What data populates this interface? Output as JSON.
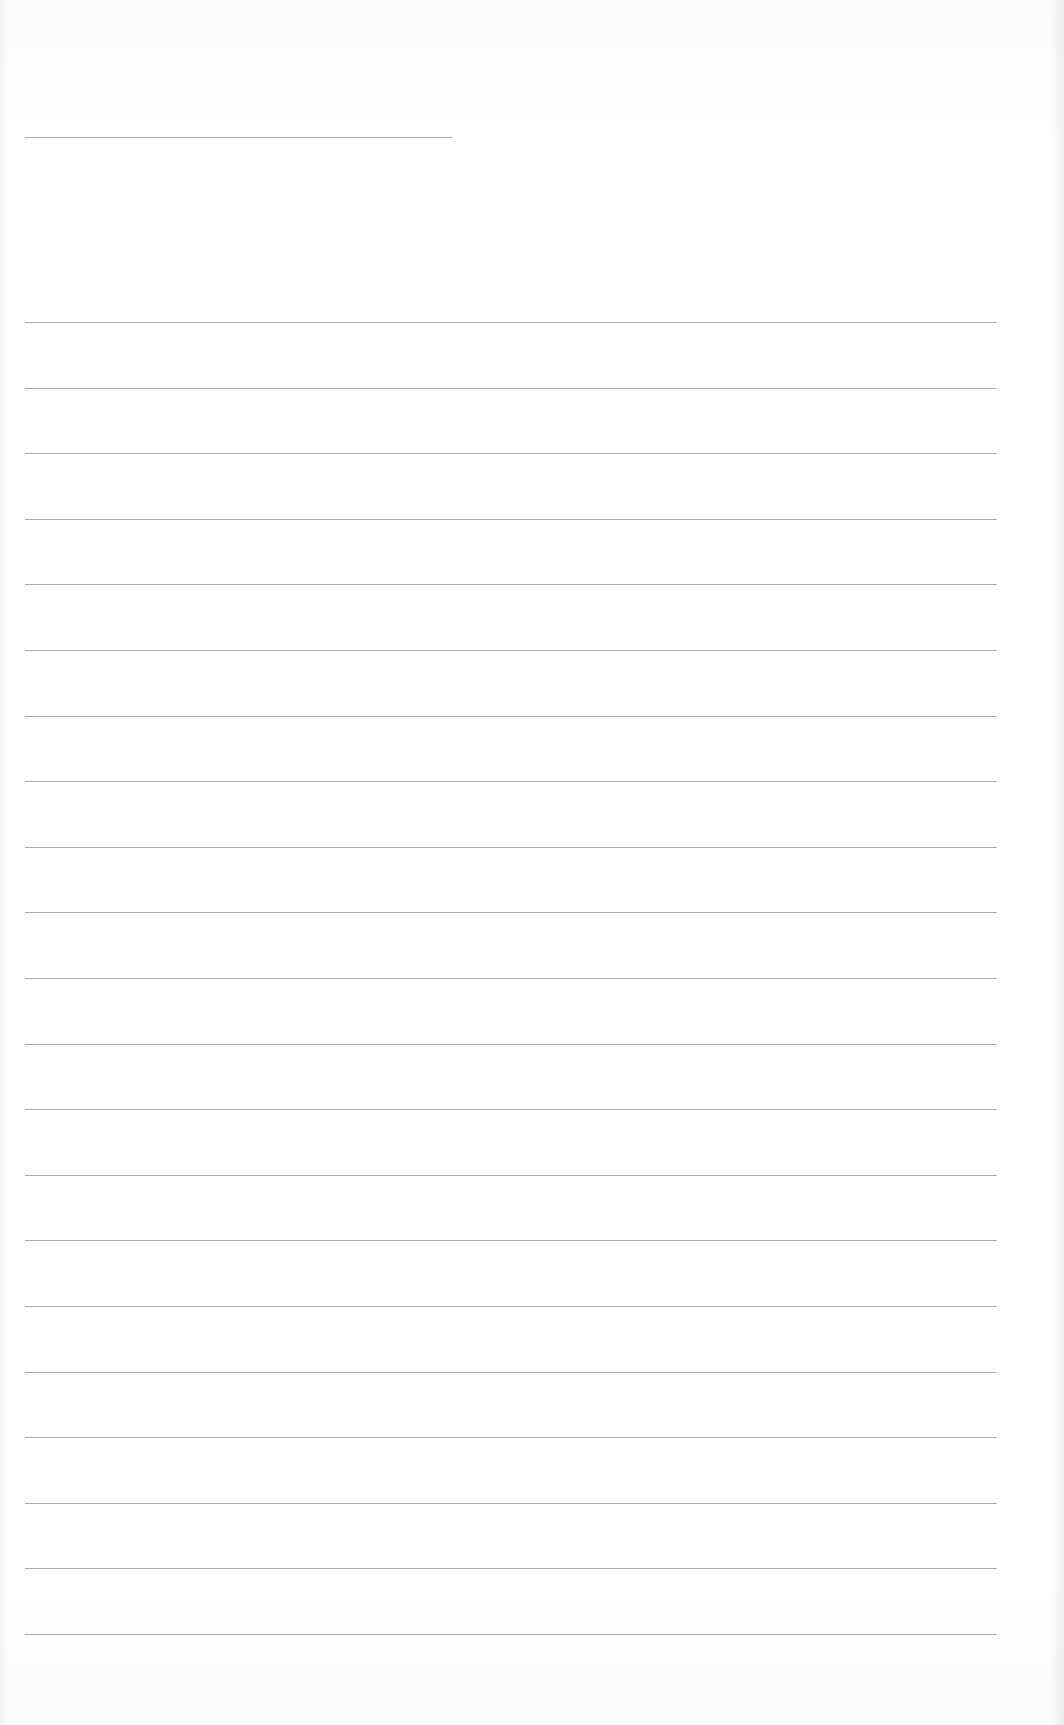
{
  "document": {
    "type": "lined-writing-sheet",
    "background_color": "#ffffff",
    "rule_color": "#9a9a9a",
    "title_rule": {
      "y": 137,
      "x_start": 25,
      "x_end": 452
    },
    "body_rules": {
      "count": 21,
      "first_y": 322,
      "spacing": 65.6,
      "x_start": 25,
      "x_end": 997
    },
    "text_content": []
  }
}
